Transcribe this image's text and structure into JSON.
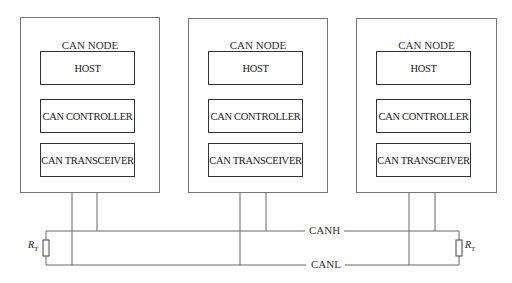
{
  "diagram": {
    "type": "CAN bus network topology",
    "nodes": [
      {
        "title": "CAN NODE",
        "blocks": [
          "HOST",
          "CAN CONTROLLER",
          "CAN TRANSCEIVER"
        ]
      },
      {
        "title": "CAN NODE",
        "blocks": [
          "HOST",
          "CAN CONTROLLER",
          "CAN TRANSCEIVER"
        ]
      },
      {
        "title": "CAN NODE",
        "blocks": [
          "HOST",
          "CAN CONTROLLER",
          "CAN TRANSCEIVER"
        ]
      }
    ],
    "bus": {
      "high_label": "CANH",
      "low_label": "CANL"
    },
    "terminators": [
      {
        "label": "R",
        "subscript": "T",
        "position": "left"
      },
      {
        "label": "R",
        "subscript": "T",
        "position": "right"
      }
    ]
  }
}
